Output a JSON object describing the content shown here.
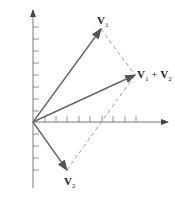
{
  "diagram": {
    "origin": [
      33,
      122
    ],
    "colors": {
      "axis": "#777777",
      "vector": "#666666",
      "dashed": "#8a8a8a",
      "text": "#222222"
    },
    "vectors": [
      {
        "id": "v1",
        "label": "V",
        "sub": "1",
        "tip": [
          101,
          29
        ]
      },
      {
        "id": "v2",
        "label": "V",
        "sub": "2",
        "tip": [
          67,
          170
        ]
      },
      {
        "id": "sum",
        "label": "V",
        "sub": "1",
        "plus": " + ",
        "label2": "V",
        "sub2": "2",
        "tip": [
          135,
          75
        ]
      }
    ],
    "x_ticks": [
      45,
      56,
      67,
      79,
      90,
      102,
      113,
      125,
      136
    ],
    "y_ticks": [
      27,
      39,
      51,
      63,
      75,
      87,
      99,
      111,
      134,
      146,
      158,
      170
    ]
  }
}
